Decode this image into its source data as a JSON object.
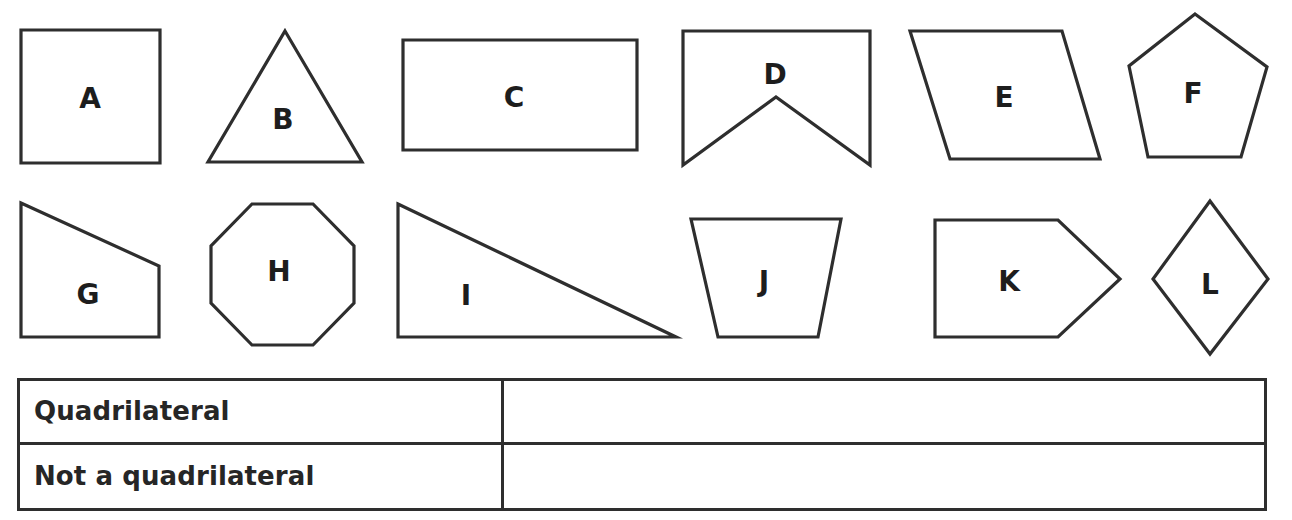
{
  "worksheet": {
    "background_color": "#ffffff",
    "stroke_color": "#2e2e2e",
    "text_color": "#1d1d1d"
  },
  "shapes": [
    {
      "label": "A",
      "name": "shape-a-square",
      "kind": "square",
      "sides": 4,
      "quadrilateral": true,
      "points": "21,30 160,30 160,163 21,163",
      "label_x": 90,
      "label_y": 98
    },
    {
      "label": "B",
      "name": "shape-b-triangle",
      "kind": "triangle",
      "sides": 3,
      "quadrilateral": false,
      "points": "285,31 362,162 208,162",
      "label_x": 283,
      "label_y": 119
    },
    {
      "label": "C",
      "name": "shape-c-rectangle",
      "kind": "rectangle",
      "sides": 4,
      "quadrilateral": true,
      "points": "403,40 637,40 637,150 403,150",
      "label_x": 514,
      "label_y": 97
    },
    {
      "label": "D",
      "name": "shape-d-concave-banner",
      "kind": "concave pentagon banner",
      "sides": 5,
      "quadrilateral": false,
      "points": "683,31 870,31 870,165 776,97 683,165",
      "label_x": 775,
      "label_y": 74
    },
    {
      "label": "E",
      "name": "shape-e-parallelogram",
      "kind": "parallelogram",
      "sides": 4,
      "quadrilateral": true,
      "points": "910,31 1062,31 1100,159 950,159",
      "label_x": 1004,
      "label_y": 97
    },
    {
      "label": "F",
      "name": "shape-f-pentagon",
      "kind": "pentagon",
      "sides": 5,
      "quadrilateral": false,
      "points": "1195,14 1267,67 1241,157 1148,157 1129,66",
      "label_x": 1193,
      "label_y": 93
    },
    {
      "label": "G",
      "name": "shape-g-right-trapezoid",
      "kind": "right trapezoid",
      "sides": 4,
      "quadrilateral": true,
      "points": "21,203 159,266 159,337 21,337",
      "label_x": 88,
      "label_y": 294
    },
    {
      "label": "H",
      "name": "shape-h-octagon",
      "kind": "octagon",
      "sides": 8,
      "quadrilateral": false,
      "points": "252,204 313,204 354,246 354,303 313,345 252,345 211,303 211,246",
      "label_x": 279,
      "label_y": 271
    },
    {
      "label": "I",
      "name": "shape-i-right-triangle",
      "kind": "right triangle",
      "sides": 3,
      "quadrilateral": false,
      "points": "398,204 676,337 398,337",
      "label_x": 466,
      "label_y": 295
    },
    {
      "label": "J",
      "name": "shape-j-trapezoid",
      "kind": "trapezoid",
      "sides": 4,
      "quadrilateral": true,
      "points": "691,219 841,219 818,337 718,337",
      "label_x": 764,
      "label_y": 281
    },
    {
      "label": "K",
      "name": "shape-k-arrow-pentagon",
      "kind": "pentagon arrow",
      "sides": 5,
      "quadrilateral": false,
      "points": "935,220 1058,220 1120,279 1058,337 935,337",
      "label_x": 1009,
      "label_y": 281
    },
    {
      "label": "L",
      "name": "shape-l-rhombus",
      "kind": "rhombus",
      "sides": 4,
      "quadrilateral": true,
      "points": "1210,201 1268,279 1210,354 1153,279",
      "label_x": 1210,
      "label_y": 284
    }
  ],
  "table": {
    "rows": [
      {
        "label": "Quadrilateral",
        "answer": ""
      },
      {
        "label": "Not a quadrilateral",
        "answer": ""
      }
    ]
  }
}
